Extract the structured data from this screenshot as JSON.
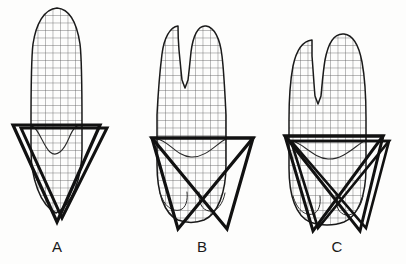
{
  "figure": {
    "background_color": "#fdfdfc",
    "outline_color": "#1a1a1a",
    "grid_color": "#5a5a5a",
    "heavy_line_color": "#111111",
    "label_color": "#1a1a1a"
  },
  "panels": [
    {
      "id": "A",
      "label": "A",
      "label_x": 57,
      "label_y": 252,
      "tooth_type": "single-cusp tooth",
      "crown_cusps": 1,
      "triangle_count": 2,
      "cervical_line_y": 125,
      "tooth_outline": "M57 8 C44 9 36 24 33 44 C31 60 31 92 31 125 L31 150 C31 178 40 205 56 213 C72 205 82 178 82 150 L82 125 C82 92 82 60 80 44 C77 24 70 9 57 8 Z",
      "grid_clip": "M57 8 C44 9 36 24 33 44 C31 60 31 92 31 125 L31 150 C31 178 40 205 56 213 C72 205 82 178 82 150 L82 125 C82 92 82 60 80 44 C77 24 70 9 57 8 Z",
      "inner_curve": "M31 126 C38 126 43 146 50 152 C57 158 64 150 69 138 C74 126 78 124 82 126",
      "triangles": [
        "M13 125 L100 125 L57 222 Z",
        "M21 128 L107 128 L62 218 Z"
      ]
    },
    {
      "id": "B",
      "label": "B",
      "label_x": 202,
      "label_y": 252,
      "tooth_type": "two-cusp tooth, narrow cusps",
      "crown_cusps": 2,
      "triangle_count": 2,
      "cervical_line_y": 138,
      "tooth_outline": "M178 26 C170 27 164 38 162 54 C160 70 158 95 157 115 L157 138 L157 165 C157 192 164 214 178 220 C186 223 196 223 204 220 C218 214 226 192 226 165 L226 138 L226 115 C225 95 224 72 222 56 C220 38 214 27 206 26 C198 25 193 36 191 52 C190 62 189 72 188 80 L185 88 L182 80 C181 71 180 60 179 50 C178 38 178 30 178 26 Z",
      "grid_clip": "M178 26 C170 27 164 38 162 54 C160 70 158 95 157 115 L157 138 L157 165 C157 192 164 214 178 220 C186 223 196 223 204 220 C218 214 226 192 226 165 L226 138 L226 115 C225 95 224 72 222 56 C220 38 214 27 206 26 C198 25 193 36 191 52 C190 62 189 72 188 80 L185 88 L182 80 C181 71 180 60 179 50 C178 38 178 30 178 26 Z",
      "inner_curve": "M157 139 C168 140 176 156 191 157 C206 158 217 143 226 139",
      "lobe_curves": [
        "M160 193 C164 206 172 212 180 210 C186 208 188 200 187 192",
        "M199 192 C198 202 202 210 209 211 C217 212 223 204 225 193"
      ],
      "triangles": [
        "M152 138 L253 138 L178 229 Z",
        "M152 138 L253 138 L227 229 Z"
      ]
    },
    {
      "id": "C",
      "label": "C",
      "label_x": 337,
      "label_y": 252,
      "tooth_type": "two-cusp tooth, broad cusps",
      "crown_cusps": 2,
      "triangle_count": 4,
      "cervical_line_y": 138,
      "tooth_outline": "M312 40 C302 41 296 52 293 66 C290 82 289 104 289 120 L289 138 L289 168 C289 196 296 216 310 222 C320 226 334 226 344 222 C358 216 366 196 366 168 L366 138 L366 118 C366 100 365 78 362 62 C359 46 353 35 344 34 C334 33 328 44 325 60 C323 72 322 86 321 96 L318 104 L315 96 C314 85 313 68 312 56 C312 48 312 43 312 40 Z",
      "grid_clip": "M312 40 C302 41 296 52 293 66 C290 82 289 104 289 120 L289 138 L289 168 C289 196 296 216 310 222 C320 226 334 226 344 222 C358 216 366 196 366 168 L366 138 L366 118 C366 100 365 78 362 62 C359 46 353 35 344 34 C334 33 328 44 325 60 C323 72 322 86 321 96 L318 104 L315 96 C314 85 313 68 312 56 C312 48 312 43 312 40 Z",
      "inner_curve": "M289 140 C302 141 312 158 328 159 C344 160 357 144 366 140",
      "lobe_curves": [
        "M293 196 C297 210 305 216 313 214 C319 212 321 204 320 196",
        "M336 195 C335 206 339 214 346 215 C354 216 361 208 363 196"
      ],
      "triangles": [
        "M285 136 L383 136 L313 231 Z",
        "M285 136 L383 136 L360 231 Z",
        "M291 141 L389 141 L318 228 Z",
        "M291 141 L389 141 L366 228 Z"
      ]
    }
  ],
  "grid": {
    "spacing": 7.5,
    "stroke_width": 0.8,
    "color": "#5a5a5a"
  },
  "labels": [
    "A",
    "B",
    "C"
  ]
}
